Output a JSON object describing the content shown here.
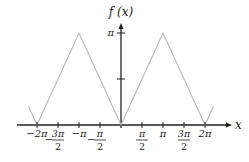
{
  "chart_data": {
    "type": "line",
    "title": "",
    "xlabel": "x",
    "ylabel": "f (x)",
    "function": "f(x) = |x| periodic (triangle wave), period 2π",
    "x": [
      -6.912,
      -6.283,
      -3.1416,
      0,
      3.1416,
      6.283,
      6.912
    ],
    "y": [
      0.628,
      0,
      3.1416,
      0,
      3.1416,
      0,
      0.628
    ],
    "xlim": [
      -7.2,
      7.6
    ],
    "ylim": [
      0,
      3.6
    ],
    "x_ticks": [
      {
        "value": -6.2832,
        "label": "−2π",
        "num": "",
        "den": ""
      },
      {
        "value": -4.7124,
        "label": "",
        "sign": "−",
        "num": "3π",
        "den": "2"
      },
      {
        "value": -3.1416,
        "label": "−π",
        "num": "",
        "den": ""
      },
      {
        "value": -1.5708,
        "label": "",
        "sign": "−",
        "num": "π",
        "den": "2"
      },
      {
        "value": 1.5708,
        "label": "",
        "sign": "",
        "num": "π",
        "den": "2"
      },
      {
        "value": 3.1416,
        "label": "π",
        "num": "",
        "den": ""
      },
      {
        "value": 4.7124,
        "label": "",
        "sign": "",
        "num": "3π",
        "den": "2"
      },
      {
        "value": 6.2832,
        "label": "2π",
        "num": "",
        "den": ""
      }
    ],
    "y_ticks": [
      {
        "value": 1.5708,
        "label": ""
      },
      {
        "value": 3.1416,
        "label": "π"
      }
    ],
    "grid": false,
    "legend": null,
    "colors": {
      "curve": "#b8b8b8",
      "axis": "#222222"
    }
  }
}
